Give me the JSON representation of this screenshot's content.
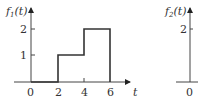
{
  "graphs": [
    {
      "id": "f1",
      "ylabel": "f",
      "ylabel_sub": "1",
      "ylabel_arg": "(t)",
      "xlabel": "t",
      "y_ticks": [
        "1",
        "2"
      ],
      "x_ticks": [
        "0",
        "2",
        "4",
        "6"
      ],
      "segments": [
        {
          "t0": 0,
          "t1": 2,
          "value": 0
        },
        {
          "t0": 2,
          "t1": 4,
          "value": 1
        },
        {
          "t0": 4,
          "t1": 6,
          "value": 2
        },
        {
          "t0": 6,
          "t1": 7,
          "value": 0
        }
      ]
    },
    {
      "id": "f2",
      "ylabel": "f",
      "ylabel_sub": "2",
      "ylabel_arg": "(t)",
      "y_ticks": [
        "2"
      ],
      "x_ticks": [
        "0"
      ]
    }
  ],
  "colors": {
    "line": "#333333",
    "axis": "#555555"
  }
}
